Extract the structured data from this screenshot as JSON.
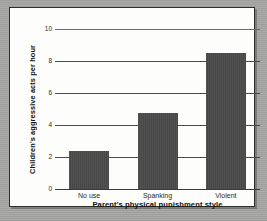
{
  "chart_data": {
    "type": "bar",
    "title": "",
    "categories": [
      "No use",
      "Spanking",
      "Violent"
    ],
    "values": [
      2.4,
      4.75,
      8.5
    ],
    "series": [
      {
        "name": "Children's aggressive acts per hour",
        "values": [
          2.4,
          4.75,
          8.5
        ]
      }
    ],
    "xlabel": "Parent's physical punishment style",
    "ylabel": "Children's aggressive acts per hour",
    "ylim": [
      0,
      10
    ],
    "yticks": [
      0,
      2,
      4,
      6,
      8,
      10
    ],
    "ytick_labels": [
      "0",
      "2",
      "4",
      "6",
      "8",
      "10"
    ],
    "grid": true,
    "legend": false,
    "bar_color": "#4a4a4a",
    "panel_color": "#fdfdfb",
    "background_color": "#a7a8a4",
    "axis_color": "#3a3a3a"
  }
}
